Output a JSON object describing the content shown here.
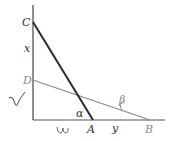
{
  "diagram": {
    "labels": {
      "C": "C",
      "x": "x",
      "D": "D",
      "alpha": "α",
      "A": "A",
      "y": "y",
      "B_axis": "B",
      "beta": "β"
    },
    "colors": {
      "axis": "#444444",
      "ladder_CA": "#2a2a2a",
      "line_DB": "#8a8a8a",
      "handwriting": "#666666"
    },
    "points": {
      "origin": [
        33,
        120
      ],
      "C": [
        33,
        22
      ],
      "D": [
        33,
        80
      ],
      "A": [
        93,
        120
      ],
      "B": [
        150,
        120
      ]
    },
    "annotations": {
      "handwritten_left": "√",
      "handwritten_bottom": "ω"
    }
  }
}
